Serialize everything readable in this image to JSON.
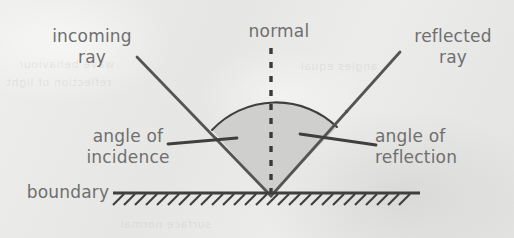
{
  "diagram": {
    "labels": {
      "incoming_ray": "incoming\nray",
      "incoming_ray_line1": "incoming",
      "incoming_ray_line2": "ray",
      "normal": "normal",
      "reflected_ray_line1": "reflected",
      "reflected_ray_line2": "ray",
      "angle_of_incidence_line1": "angle of",
      "angle_of_incidence_line2": "incidence",
      "angle_of_reflection_line1": "angle of",
      "angle_of_reflection_line2": "reflection",
      "boundary": "boundary"
    },
    "colors": {
      "paper_background": "#e9e9e7",
      "text": "#6f6f6f",
      "ray_stroke": "#555555",
      "normal_dash": "#3a3a3a",
      "wedge_fill": "#cfcfcd",
      "boundary_stroke": "#3f3f3f",
      "hatch_stroke": "#3f3f3f"
    },
    "geometry": {
      "vertex_x": 271,
      "vertex_y": 196,
      "normal_top_y": 48,
      "boundary_left_x": 113,
      "boundary_right_x": 420,
      "boundary_y": 193,
      "incoming_start_x": 137,
      "incoming_start_y": 57,
      "reflected_end_x": 400,
      "reflected_end_y": 52,
      "arc_left_x": 212,
      "arc_left_y": 130,
      "arc_right_x": 337,
      "arc_right_y": 127,
      "hatch_count": 27
    },
    "bleed_text": [
      "wave behaviour",
      "reflection of light",
      "angles equal",
      "surface normal"
    ]
  }
}
